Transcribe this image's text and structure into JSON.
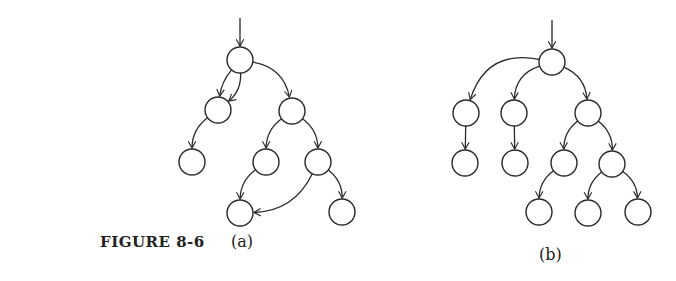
{
  "figure": {
    "label": "FIGURE 8-6"
  },
  "panels": [
    {
      "id": "a",
      "caption": "(a)",
      "nodes": [
        "n1",
        "n2",
        "n3",
        "n4",
        "n5",
        "n6",
        "n7",
        "n8"
      ],
      "edges": [
        {
          "from": "entry",
          "to": "n1"
        },
        {
          "from": "n1",
          "to": "n2"
        },
        {
          "from": "n1",
          "to": "n2",
          "parallel": true
        },
        {
          "from": "n1",
          "to": "n3"
        },
        {
          "from": "n2",
          "to": "n4"
        },
        {
          "from": "n3",
          "to": "n5"
        },
        {
          "from": "n3",
          "to": "n6"
        },
        {
          "from": "n5",
          "to": "n7"
        },
        {
          "from": "n6",
          "to": "n7"
        },
        {
          "from": "n6",
          "to": "n8"
        }
      ]
    },
    {
      "id": "b",
      "caption": "(b)",
      "nodes": [
        "m1",
        "m2",
        "m3",
        "m4",
        "m5",
        "m6",
        "m7",
        "m8",
        "m9",
        "m10",
        "m11"
      ],
      "edges": [
        {
          "from": "entry",
          "to": "m1"
        },
        {
          "from": "m1",
          "to": "m2"
        },
        {
          "from": "m1",
          "to": "m3"
        },
        {
          "from": "m1",
          "to": "m4"
        },
        {
          "from": "m2",
          "to": "m5"
        },
        {
          "from": "m3",
          "to": "m6"
        },
        {
          "from": "m4",
          "to": "m7"
        },
        {
          "from": "m4",
          "to": "m8"
        },
        {
          "from": "m7",
          "to": "m9"
        },
        {
          "from": "m8",
          "to": "m10"
        },
        {
          "from": "m8",
          "to": "m11"
        }
      ]
    }
  ]
}
